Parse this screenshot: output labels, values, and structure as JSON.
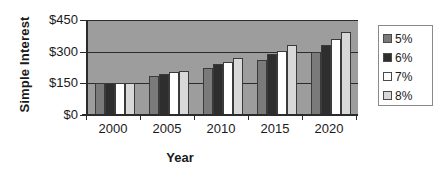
{
  "chart_data": {
    "type": "bar",
    "title": "",
    "xlabel": "Year",
    "ylabel": "Simple Interest",
    "categories": [
      "2000",
      "2005",
      "2010",
      "2015",
      "2020"
    ],
    "ylim": [
      0,
      450
    ],
    "yticks": [
      "$0",
      "$150",
      "$300",
      "$450"
    ],
    "ytick_values": [
      0,
      150,
      300,
      450
    ],
    "grid": true,
    "legend_position": "right",
    "series": [
      {
        "name": "5%",
        "color": "#7a7a7a",
        "values": [
          150,
          187,
          225,
          262,
          300
        ]
      },
      {
        "name": "6%",
        "color": "#2e2e2e",
        "values": [
          150,
          195,
          240,
          288,
          330
        ]
      },
      {
        "name": "7%",
        "color": "#ffffff",
        "values": [
          150,
          205,
          250,
          305,
          360
        ]
      },
      {
        "name": "8%",
        "color": "#d8d8d8",
        "values": [
          150,
          210,
          270,
          330,
          392
        ]
      }
    ]
  },
  "legend": {
    "items": [
      {
        "label": "5%"
      },
      {
        "label": "6%"
      },
      {
        "label": "7%"
      },
      {
        "label": "8%"
      }
    ]
  },
  "colors": {
    "plot_background": "#9d9d9d",
    "axis": "#2b2b2b",
    "text": "#1a1a1a",
    "page_background": "#ffffff"
  }
}
